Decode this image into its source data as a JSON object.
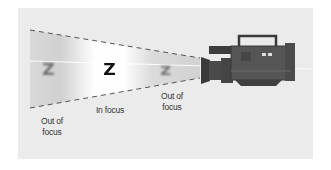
{
  "figure": {
    "background_color": "#ebebeb",
    "subjects": [
      {
        "glyph": "Z",
        "state": "blurred",
        "color": "#6e6e6e"
      },
      {
        "glyph": "Z",
        "state": "sharp",
        "color": "#111111"
      },
      {
        "glyph": "Z",
        "state": "blurred",
        "color": "#6e6e6e"
      }
    ],
    "labels": {
      "left_out_line1": "Out of",
      "left_out_line2": "focus",
      "in_focus": "In focus",
      "right_out_line1": "Out of",
      "right_out_line2": "focus"
    },
    "camera": {
      "name": "video-camera",
      "color": "#4a4a4a"
    }
  }
}
